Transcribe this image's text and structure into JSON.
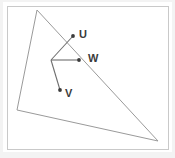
{
  "figure": {
    "background_color": "#ffffff",
    "outer_color": "#f3f3f3",
    "frame_color": "#c9c9c9",
    "triangle_stroke": "#9a9a9a",
    "vector_stroke": "#6e6e6e",
    "label_color": "#3b3b3b",
    "frame": {
      "x": 7,
      "y": 6,
      "width": 161,
      "height": 143
    },
    "triangle": {
      "name": "triangle-outline",
      "points": "37,10 17,110 158,141",
      "vertices": [
        {
          "name": "apex",
          "x": 37,
          "y": 10
        },
        {
          "name": "lower-left",
          "x": 17,
          "y": 110
        },
        {
          "name": "lower-right",
          "x": 158,
          "y": 141
        }
      ]
    },
    "origin": {
      "x": 51,
      "y": 60
    },
    "vectors": [
      {
        "id": "u",
        "label": "U",
        "x1": 51,
        "y1": 60,
        "x2": 73,
        "y2": 36,
        "label_x": 79,
        "label_y": 38
      },
      {
        "id": "w",
        "label": "W",
        "x1": 51,
        "y1": 60,
        "x2": 79,
        "y2": 60,
        "label_x": 88,
        "label_y": 62
      },
      {
        "id": "v",
        "label": "V",
        "x1": 51,
        "y1": 60,
        "x2": 60,
        "y2": 90,
        "label_x": 65,
        "label_y": 97
      }
    ]
  }
}
